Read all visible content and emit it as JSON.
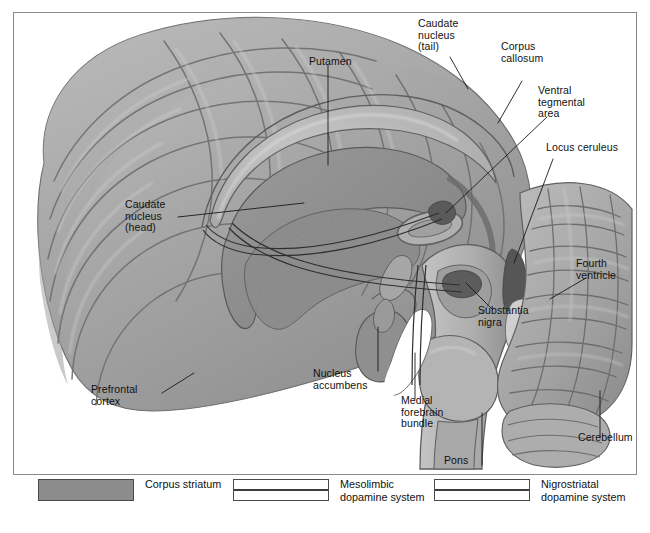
{
  "figure": {
    "labels": [
      {
        "id": "putamen",
        "text": "Putamen",
        "x": 308,
        "y": 48,
        "align": "left"
      },
      {
        "id": "caudate-tail",
        "text": "Caudate\nnucleus\n(tail)",
        "x": 408,
        "y": 10,
        "align": "left"
      },
      {
        "id": "corpus-callosum",
        "text": "Corpus\ncallosum",
        "x": 494,
        "y": 42,
        "align": "left"
      },
      {
        "id": "ventral-tegmental",
        "text": "Ventral\ntegmental\narea",
        "x": 536,
        "y": 83,
        "align": "left"
      },
      {
        "id": "locus-ceruleus",
        "text": "Locus ceruleus",
        "x": 543,
        "y": 140,
        "align": "left"
      },
      {
        "id": "caudate-head",
        "text": "Caudate\nnucleus\n(head)",
        "x": 127,
        "y": 198,
        "align": "left"
      },
      {
        "id": "fourth-ventricle",
        "text": "Fourth\nventricle",
        "x": 576,
        "y": 255,
        "align": "left"
      },
      {
        "id": "substantia-nigra",
        "text": "Substantia\nnigra",
        "x": 478,
        "y": 303,
        "align": "left"
      },
      {
        "id": "nucleus-accumbens",
        "text": "Nucleus\naccumbens",
        "x": 313,
        "y": 366,
        "align": "left"
      },
      {
        "id": "prefrontal-cortex",
        "text": "Prefrontal\ncortex",
        "x": 92,
        "y": 382,
        "align": "left"
      },
      {
        "id": "medial-forebrain",
        "text": "Medial\nforebrain\nbundle",
        "x": 400,
        "y": 393,
        "align": "left"
      },
      {
        "id": "cerebellum",
        "text": "Cerebellum",
        "x": 579,
        "y": 430,
        "align": "left"
      },
      {
        "id": "pons",
        "text": "Pons",
        "x": 444,
        "y": 453,
        "align": "left"
      }
    ],
    "colors": {
      "corpus_striatum": "#8c8c8c",
      "tract_line": "#3d3d3d",
      "frame_border": "#8a8a8a",
      "cortex_light": "#b9b9b9",
      "cortex_mid": "#9d9d9d",
      "cortex_dark": "#7c7c7c",
      "brainstem": "#b0b0b0",
      "ventricle_white": "#ffffff",
      "text": "#111111"
    }
  },
  "legend": {
    "items": [
      {
        "id": "corpus-striatum",
        "swatch": "solid",
        "label": "Corpus striatum",
        "x": 38
      },
      {
        "id": "mesolimbic-system",
        "swatch": "tract",
        "label": "Mesolimbic\ndopamine system",
        "x": 233
      },
      {
        "id": "nigrostriatal-system",
        "swatch": "tract",
        "label": "Nigrostriatal\ndopamine system",
        "x": 434
      }
    ]
  }
}
